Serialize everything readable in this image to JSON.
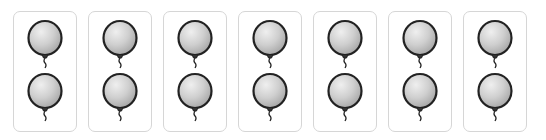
{
  "cards": [
    {
      "balloons": 2
    },
    {
      "balloons": 2
    },
    {
      "balloons": 2
    },
    {
      "balloons": 2
    },
    {
      "balloons": 2
    },
    {
      "balloons": 2
    },
    {
      "balloons": 2
    }
  ],
  "total_balloons": 14,
  "colors": {
    "card_border": "#d6d6d6",
    "balloon_fill": "#c8c8c8",
    "balloon_outline": "#222222"
  }
}
